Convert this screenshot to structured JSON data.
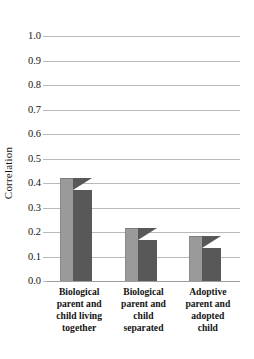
{
  "chart_data": {
    "type": "bar",
    "title": "",
    "subtitle": "",
    "xlabel": "",
    "ylabel": "Correlation",
    "ylim": [
      0.0,
      1.0
    ],
    "ytick_labels": [
      "1.0",
      "0.9",
      "0.8",
      "0.7",
      "0.6",
      "0.5",
      "0.4",
      "0.3",
      "0.2",
      "0.1",
      "0.0"
    ],
    "ytick_values": [
      1.0,
      0.9,
      0.8,
      0.7,
      0.6,
      0.5,
      0.4,
      0.3,
      0.2,
      0.1,
      0.0
    ],
    "grid": "horizontal",
    "legend": "none",
    "style": "3d-bars",
    "categories": [
      "Biological parent and child living together",
      "Biological parent and child separated",
      "Adoptive parent and adopted child"
    ],
    "category_lines": [
      [
        "Biological",
        "parent and",
        "child living",
        "together"
      ],
      [
        "Biological",
        "parent and",
        "child",
        "separated"
      ],
      [
        "Adoptive",
        "parent and",
        "adopted",
        "child"
      ]
    ],
    "values": [
      0.42,
      0.215,
      0.185
    ],
    "annotations": []
  },
  "colors": {
    "bar_front": "#9a9a9a",
    "bar_side": "#585858",
    "gridline": "#b9b9b9",
    "baseline": "#9c9c9c",
    "text": "#141414",
    "background": "#ffffff"
  }
}
